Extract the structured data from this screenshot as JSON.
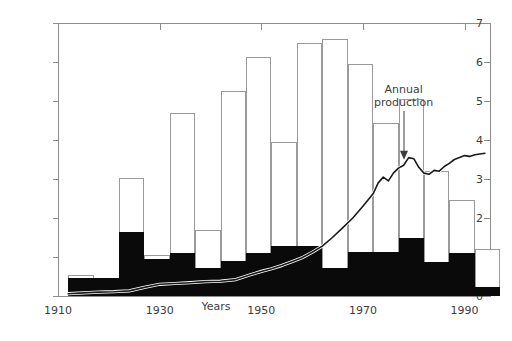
{
  "chart_data": {
    "type": "bar",
    "title": "",
    "xlabel": "Years",
    "ylabel": "Crude oil, billions of cubic meters/yr",
    "xlim": [
      1910,
      1995
    ],
    "ylim": [
      0,
      7
    ],
    "yticks": [
      0,
      1,
      2,
      3,
      4,
      5,
      6,
      7
    ],
    "ytick_labels": [
      "0",
      "1",
      "2",
      "3",
      "4",
      "5",
      "6",
      "7"
    ],
    "xticks": [
      1910,
      1930,
      1950,
      1970,
      1990
    ],
    "xtick_labels": [
      "1910",
      "1930",
      "1950",
      "1970",
      "1990"
    ],
    "grid": false,
    "legend": "none",
    "annotations": [
      {
        "text": "Annual\nproduction",
        "x": 1978,
        "y": 4.9,
        "arrow_to_x": 1978,
        "arrow_to_y": 3.55
      }
    ],
    "bar_interval_years": 5,
    "bar_series": [
      {
        "name": "Discoveries (total, outline bars)",
        "color": "#ffffff",
        "edge": "#9a9a9a"
      },
      {
        "name": "Lower portion (filled black)",
        "color": "#0a0a0a"
      }
    ],
    "bars": [
      {
        "period": "1912",
        "x_start": 1912,
        "total": 0.55,
        "black": 0.46
      },
      {
        "period": "1917",
        "x_start": 1917,
        "total": 0.47,
        "black": 0.47
      },
      {
        "period": "1922",
        "x_start": 1922,
        "total": 3.03,
        "black": 1.63
      },
      {
        "period": "1927",
        "x_start": 1927,
        "total": 1.05,
        "black": 0.95
      },
      {
        "period": "1932",
        "x_start": 1932,
        "total": 4.7,
        "black": 1.11
      },
      {
        "period": "1937",
        "x_start": 1937,
        "total": 1.7,
        "black": 0.73
      },
      {
        "period": "1942",
        "x_start": 1942,
        "total": 5.25,
        "black": 0.9
      },
      {
        "period": "1947",
        "x_start": 1947,
        "total": 6.12,
        "black": 1.11
      },
      {
        "period": "1952",
        "x_start": 1952,
        "total": 3.95,
        "black": 1.28
      },
      {
        "period": "1957",
        "x_start": 1957,
        "total": 6.5,
        "black": 1.28
      },
      {
        "period": "1962",
        "x_start": 1962,
        "total": 6.58,
        "black": 0.71
      },
      {
        "period": "1967",
        "x_start": 1967,
        "total": 5.95,
        "black": 1.13
      },
      {
        "period": "1972",
        "x_start": 1972,
        "total": 4.43,
        "black": 1.13
      },
      {
        "period": "1977",
        "x_start": 1977,
        "total": 5.05,
        "black": 1.5
      },
      {
        "period": "1982",
        "x_start": 1982,
        "total": 3.2,
        "black": 0.88
      },
      {
        "period": "1987",
        "x_start": 1987,
        "total": 2.45,
        "black": 1.1
      },
      {
        "period": "1992",
        "x_start": 1992,
        "total": 1.2,
        "black": 0.24
      }
    ],
    "line": {
      "name": "Annual production",
      "color": "#1a1a1a",
      "points": [
        [
          1912,
          0.06
        ],
        [
          1915,
          0.08
        ],
        [
          1918,
          0.1
        ],
        [
          1921,
          0.11
        ],
        [
          1924,
          0.13
        ],
        [
          1927,
          0.22
        ],
        [
          1930,
          0.3
        ],
        [
          1933,
          0.32
        ],
        [
          1936,
          0.34
        ],
        [
          1939,
          0.37
        ],
        [
          1942,
          0.38
        ],
        [
          1945,
          0.42
        ],
        [
          1948,
          0.55
        ],
        [
          1950,
          0.63
        ],
        [
          1952,
          0.7
        ],
        [
          1954,
          0.78
        ],
        [
          1956,
          0.88
        ],
        [
          1958,
          0.98
        ],
        [
          1960,
          1.12
        ],
        [
          1962,
          1.28
        ],
        [
          1964,
          1.5
        ],
        [
          1966,
          1.75
        ],
        [
          1968,
          2.0
        ],
        [
          1970,
          2.3
        ],
        [
          1972,
          2.62
        ],
        [
          1973,
          2.9
        ],
        [
          1974,
          3.05
        ],
        [
          1975,
          2.95
        ],
        [
          1976,
          3.15
        ],
        [
          1977,
          3.28
        ],
        [
          1978,
          3.35
        ],
        [
          1979,
          3.55
        ],
        [
          1980,
          3.52
        ],
        [
          1981,
          3.3
        ],
        [
          1982,
          3.15
        ],
        [
          1983,
          3.12
        ],
        [
          1984,
          3.22
        ],
        [
          1985,
          3.2
        ],
        [
          1986,
          3.32
        ],
        [
          1987,
          3.4
        ],
        [
          1988,
          3.5
        ],
        [
          1989,
          3.55
        ],
        [
          1990,
          3.6
        ],
        [
          1991,
          3.58
        ],
        [
          1992,
          3.62
        ],
        [
          1993,
          3.64
        ],
        [
          1994,
          3.66
        ]
      ]
    }
  },
  "axis": {
    "y_title": "Crude oil, billions of cubic meters/yr",
    "x_title": "Years"
  },
  "annotation": {
    "label": "Annual\nproduction"
  }
}
